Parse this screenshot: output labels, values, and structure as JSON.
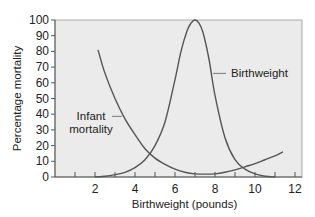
{
  "chart_data": {
    "type": "line",
    "title": "",
    "xlabel": "Birthweight (pounds)",
    "ylabel": "Percentage mortality",
    "xlim": [
      0,
      12.2
    ],
    "ylim": [
      0,
      100
    ],
    "xticks": [
      2,
      4,
      6,
      8,
      10,
      12
    ],
    "xminor_ticks": [
      1,
      3,
      5,
      7,
      9,
      11
    ],
    "yticks": [
      0,
      10,
      20,
      30,
      40,
      50,
      60,
      70,
      80,
      90,
      100
    ],
    "grid": false,
    "background": "#ebebeb",
    "line_color": "#555555",
    "series": [
      {
        "name": "Infant mortality",
        "x": [
          2.15,
          2.5,
          3,
          3.5,
          4,
          4.5,
          5,
          5.5,
          6,
          6.5,
          7,
          7.5,
          8,
          8.5,
          9,
          9.5,
          10,
          10.5,
          11,
          11.4
        ],
        "y": [
          81,
          66,
          50,
          37,
          27,
          18,
          12,
          8,
          5,
          3,
          2,
          1.8,
          2,
          3,
          4.5,
          6.5,
          8.5,
          11,
          13.5,
          16
        ]
      },
      {
        "name": "Birthweight",
        "x": [
          2,
          2.5,
          3,
          3.5,
          4,
          4.5,
          5,
          5.5,
          6,
          6.3,
          6.6,
          6.8,
          7,
          7.2,
          7.4,
          7.7,
          8,
          8.5,
          9,
          9.5,
          10,
          10.5,
          11
        ],
        "y": [
          0,
          0.5,
          1.5,
          3,
          6,
          11,
          20,
          35,
          62,
          80,
          93,
          98,
          100,
          98,
          92,
          75,
          52,
          25,
          11,
          5,
          2,
          0.5,
          0
        ]
      }
    ],
    "annotations": [
      {
        "text": "Birthweight",
        "points_to": "Birthweight",
        "at_x": 7.8,
        "at_y": 66
      },
      {
        "text_lines": [
          "Infant",
          "mortality"
        ],
        "points_to": "Infant mortality",
        "at_x": 3.5,
        "at_y": 38
      }
    ]
  }
}
